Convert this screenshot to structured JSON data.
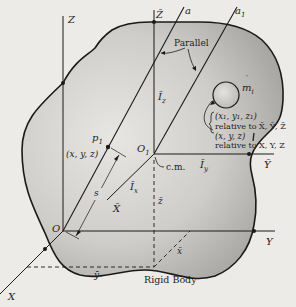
{
  "figure": {
    "body_label": "Rigid Body",
    "axes": {
      "Z": "Z",
      "Y": "Y",
      "X": "X",
      "O": "O",
      "Zbar": "Z̄",
      "Ybar": "Ȳ",
      "Xbar": "X̄",
      "O1": "O",
      "O1_sub": "1",
      "a": "a",
      "a1": "a",
      "a1_sub": "1"
    },
    "labels": {
      "parallel": "Parallel",
      "cm": "c.m.",
      "Iz": "Ī",
      "Iz_sub": "z",
      "Iy": "Ī",
      "Iy_sub": "y",
      "Ix": "Ī",
      "Ix_sub": "x",
      "s": "s",
      "p1": "p",
      "p1_sub": "1",
      "p1_coords": "(x, y, z)",
      "mass": "m",
      "mass_sub": "i",
      "mass_prime": "′",
      "zbar": "z̄",
      "ybar": "ȳ",
      "xbar": "x̄",
      "coords1": "(x₁, y₁, z₁)",
      "rel1": "relative to X̄, Ȳ, Z̄",
      "coords2": "(x, y, z)",
      "rel2": "relative to X, Y, Z"
    },
    "colors": {
      "background": "#ecebe8",
      "body_fill_light": "#e6e4e0",
      "body_fill_dark": "#a9a7a3",
      "line": "#1a1a1a"
    }
  }
}
